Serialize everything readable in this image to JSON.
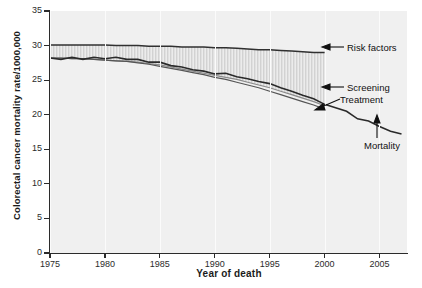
{
  "chart_data": {
    "type": "line",
    "title": "",
    "xlabel": "Year of death",
    "ylabel": "Colorectal cancer mortality rate/1000,000",
    "xlim": [
      1975,
      2007.5
    ],
    "ylim": [
      0,
      35
    ],
    "xticks": [
      1975,
      1980,
      1985,
      1990,
      1995,
      2000,
      2005
    ],
    "yticks": [
      0,
      5,
      10,
      15,
      20,
      25,
      30,
      35
    ],
    "grid": "vertical-faint",
    "legend": "none",
    "annotations": [
      {
        "label": "Risk factors",
        "arrow": "left",
        "target_x": 2000,
        "target_y": 29.0
      },
      {
        "label": "Screening",
        "arrow": "left",
        "target_x": 2000,
        "target_y": 24.0
      },
      {
        "label": "Treatment",
        "arrow": "left",
        "target_x": 2000.5,
        "target_y": 20.6
      },
      {
        "label": "Mortality",
        "arrow": "up",
        "target_x": 2003.5,
        "target_y": 19.1
      }
    ],
    "x": [
      1975,
      1976,
      1977,
      1978,
      1979,
      1980,
      1981,
      1982,
      1983,
      1984,
      1985,
      1986,
      1987,
      1988,
      1989,
      1990,
      1991,
      1992,
      1993,
      1994,
      1995,
      1996,
      1997,
      1998,
      1999,
      2000,
      2001,
      2002,
      2003,
      2004,
      2005,
      2006,
      2007
    ],
    "series": [
      {
        "name": "Risk factors",
        "color": "#303030",
        "values": [
          30.1,
          30.1,
          30.1,
          30.1,
          30.1,
          30.1,
          30.0,
          30.0,
          30.0,
          29.9,
          29.9,
          29.9,
          29.8,
          29.8,
          29.8,
          29.7,
          29.7,
          29.6,
          29.5,
          29.4,
          29.4,
          29.3,
          29.2,
          29.1,
          29.0,
          29.0,
          null,
          null,
          null,
          null,
          null,
          null,
          null
        ]
      },
      {
        "name": "Screening",
        "color": "#8a8a8a",
        "values": [
          28.2,
          28.2,
          28.1,
          28.1,
          28.0,
          27.9,
          27.8,
          27.7,
          27.6,
          27.4,
          27.2,
          26.9,
          26.6,
          26.3,
          26.0,
          25.7,
          25.4,
          25.1,
          24.7,
          24.3,
          23.9,
          23.4,
          22.9,
          22.4,
          21.9,
          21.3,
          null,
          null,
          null,
          null,
          null,
          null,
          null
        ]
      },
      {
        "name": "Treatment",
        "color": "#555555",
        "values": [
          28.2,
          28.2,
          28.1,
          28.1,
          28.0,
          27.9,
          27.8,
          27.7,
          27.5,
          27.3,
          27.0,
          26.7,
          26.4,
          26.1,
          25.8,
          25.4,
          25.1,
          24.7,
          24.3,
          23.9,
          23.4,
          22.9,
          22.4,
          21.9,
          21.4,
          20.8,
          null,
          null,
          null,
          null,
          null,
          null,
          null
        ]
      },
      {
        "name": "Mortality",
        "color": "#2a2a2a",
        "values": [
          28.2,
          28.0,
          28.3,
          28.0,
          28.3,
          28.1,
          28.3,
          28.0,
          28.0,
          27.6,
          27.6,
          27.1,
          26.9,
          26.5,
          26.3,
          25.9,
          26.0,
          25.5,
          25.2,
          24.8,
          24.5,
          23.9,
          23.4,
          22.8,
          22.3,
          21.5,
          21.0,
          20.5,
          19.4,
          19.1,
          18.3,
          17.6,
          17.2
        ]
      }
    ],
    "shaded_band": {
      "label": "gap between risk factors and screening/treatment",
      "pattern": "vertical-hatch",
      "color": "#d6d6d6"
    }
  },
  "axis": {
    "y_tick_labels": [
      "0",
      "5",
      "10",
      "15",
      "20",
      "25",
      "30",
      "35"
    ],
    "x_tick_labels": [
      "1975",
      "1980",
      "1985",
      "1990",
      "1995",
      "2000",
      "2005"
    ]
  },
  "annotations": {
    "risk_factors": "Risk factors",
    "screening": "Screening",
    "treatment": "Treatment",
    "mortality": "Mortality"
  }
}
